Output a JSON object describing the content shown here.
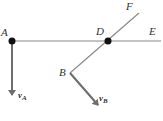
{
  "diagram": {
    "points": {
      "A": {
        "label": "A",
        "x": 12,
        "y": 41
      },
      "D": {
        "label": "D",
        "x": 108,
        "y": 41
      },
      "B": {
        "label": "B",
        "x": 70,
        "y": 73
      },
      "E": {
        "label": "E",
        "x": 160,
        "y": 41
      },
      "F": {
        "label": "F",
        "x": 139,
        "y": 13
      }
    },
    "vectors": {
      "vA": {
        "symbol": "v",
        "subscript": "A"
      },
      "vB": {
        "symbol": "v",
        "subscript": "B"
      }
    },
    "colors": {
      "line": "#8a8a8a",
      "arrow": "#6e6e6e",
      "dot": "#111111",
      "text": "#333333"
    }
  }
}
